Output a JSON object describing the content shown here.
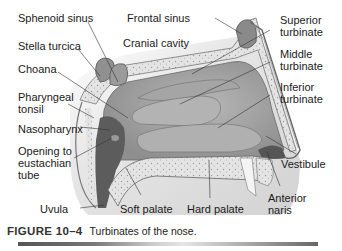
{
  "figure": {
    "labels": {
      "sphenoid_sinus": "Sphenoid sinus",
      "frontal_sinus": "Frontal sinus",
      "stella_turcica": "Stella turcica",
      "cranial_cavity": "Cranial cavity",
      "choana": "Choana",
      "pharyngeal_tonsil_1": "Pharyngeal",
      "pharyngeal_tonsil_2": "tonsil",
      "nasopharynx": "Nasopharynx",
      "eustachian_1": "Opening to",
      "eustachian_2": "eustachian",
      "eustachian_3": "tube",
      "uvula": "Uvula",
      "soft_palate": "Soft palate",
      "hard_palate": "Hard palate",
      "superior_1": "Superior",
      "superior_2": "turbinate",
      "middle_1": "Middle",
      "middle_2": "turbinate",
      "inferior_1": "Inferior",
      "inferior_2": "turbinate",
      "vestibule": "Vestibule",
      "anterior_naris_1": "Anterior",
      "anterior_naris_2": "naris"
    },
    "caption": {
      "number": "FIGURE 10–4",
      "text": "Turbinates of the nose."
    }
  }
}
